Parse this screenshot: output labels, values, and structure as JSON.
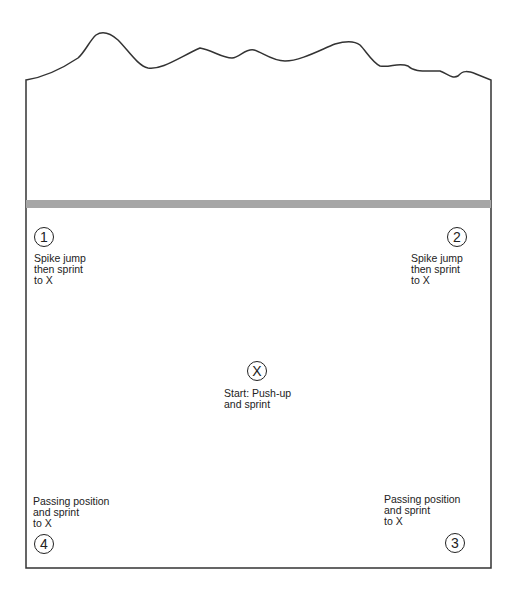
{
  "diagram": {
    "type": "volleyball court drill layout",
    "colors": {
      "line": "#333333",
      "net": "#a6a6a6",
      "background": "#ffffff"
    },
    "stations": [
      {
        "id": "1",
        "symbol": "1",
        "label": "Spike jump\nthen sprint\nto X"
      },
      {
        "id": "2",
        "symbol": "2",
        "label": "Spike jump\nthen sprint\nto X"
      },
      {
        "id": "X",
        "symbol": "X",
        "label": "Start: Push-up\nand sprint"
      },
      {
        "id": "3",
        "symbol": "3",
        "label": "Passing position\nand sprint\nto X"
      },
      {
        "id": "4",
        "symbol": "4",
        "label": "Passing position\nand sprint\nto X"
      }
    ]
  }
}
